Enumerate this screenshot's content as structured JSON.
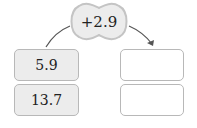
{
  "operation": {
    "label": "+2.9",
    "icon": "cloud-shape"
  },
  "left_column": {
    "values": [
      "5.9",
      "13.7"
    ]
  },
  "right_column": {
    "values": [
      "",
      ""
    ]
  },
  "colors": {
    "filled_box": "#ececec",
    "border": "#b8b8b8",
    "arrow": "#555555"
  }
}
